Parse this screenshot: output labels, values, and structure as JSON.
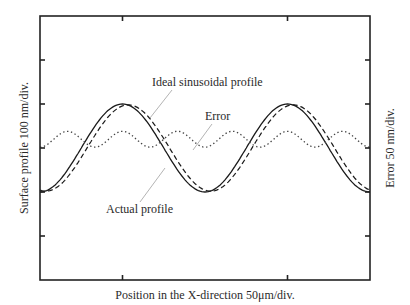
{
  "chart_data": {
    "type": "line",
    "title": "",
    "xlabel": "Position in the X-direction 50μm/div.",
    "ylabel": "Surface profile 100 nm/div.",
    "y2label": "Error 50 nm/div.",
    "x_unit": "div",
    "xlim": [
      0,
      4
    ],
    "ylim": [
      -3,
      3
    ],
    "y2lim": [
      -3,
      3
    ],
    "x_ticks": [
      1,
      3
    ],
    "y_ticks": [
      -2,
      -1,
      0,
      1,
      2
    ],
    "y2_ticks": [
      -2,
      -1,
      0,
      1,
      2
    ],
    "grid": false,
    "legend": "none",
    "series": [
      {
        "name": "Ideal sinusoidal profile",
        "style": "solid",
        "axis": "left",
        "description": "sinusoid, amplitude 1 div, period 2 div, peak at x=1 and x=3",
        "x": [
          0,
          0.25,
          0.5,
          0.75,
          1,
          1.25,
          1.5,
          1.75,
          2,
          2.25,
          2.5,
          2.75,
          3,
          3.25,
          3.5,
          3.75,
          4
        ],
        "values": [
          -1,
          -0.71,
          0,
          0.71,
          1,
          0.71,
          0,
          -0.71,
          -1,
          -0.71,
          0,
          0.71,
          1,
          0.71,
          0,
          -0.71,
          -1
        ]
      },
      {
        "name": "Actual profile",
        "style": "dashed",
        "axis": "left",
        "description": "slightly phase-lagged sinusoid following the ideal profile",
        "x": [
          0,
          0.25,
          0.5,
          0.75,
          1,
          1.25,
          1.5,
          1.75,
          2,
          2.25,
          2.5,
          2.75,
          3,
          3.25,
          3.5,
          3.75,
          4
        ],
        "values": [
          -0.98,
          -0.8,
          -0.12,
          0.6,
          0.97,
          0.8,
          0.12,
          -0.6,
          -0.97,
          -0.8,
          -0.12,
          0.6,
          0.97,
          0.8,
          0.12,
          -0.6,
          -0.98
        ]
      },
      {
        "name": "Error",
        "style": "dotted",
        "axis": "right",
        "description": "small periodic error, oscillating between about 0 and 0.4 div",
        "x": [
          0,
          0.33,
          0.67,
          1,
          1.33,
          1.67,
          2,
          2.33,
          2.67,
          3,
          3.33,
          3.67,
          4
        ],
        "values": [
          0.1,
          0.3,
          0.4,
          0.05,
          0.4,
          0.3,
          0.0,
          0.3,
          0.4,
          0.05,
          0.4,
          0.3,
          0.1
        ]
      }
    ],
    "annotations": [
      {
        "text": "Ideal sinusoidal profile",
        "points_to": "Ideal sinusoidal profile"
      },
      {
        "text": "Error",
        "points_to": "Error"
      },
      {
        "text": "Actual profile",
        "points_to": "Actual profile"
      }
    ]
  }
}
